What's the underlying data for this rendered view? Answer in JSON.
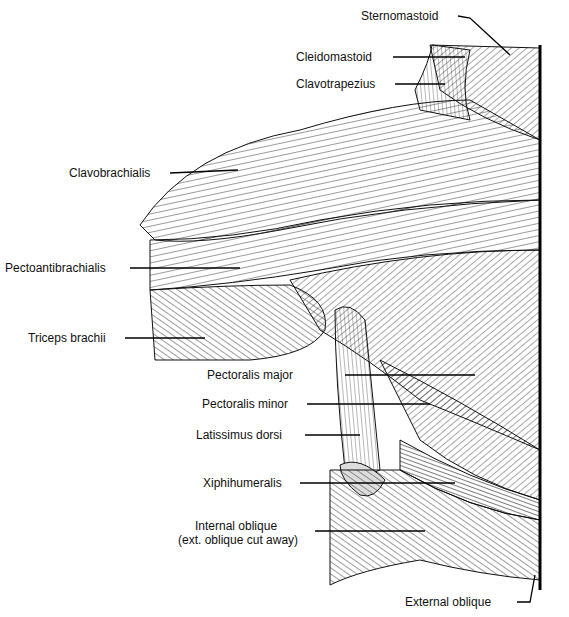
{
  "figure": {
    "labels": [
      {
        "id": "sternomastoid",
        "text": "Sternomastoid"
      },
      {
        "id": "cleidomastoid",
        "text": "Cleidomastoid"
      },
      {
        "id": "clavotrapezius",
        "text": "Clavotrapezius"
      },
      {
        "id": "clavobrachialis",
        "text": "Clavobrachialis"
      },
      {
        "id": "pectoantibrachialis",
        "text": "Pectoantibrachialis"
      },
      {
        "id": "triceps-brachii",
        "text": "Triceps brachii"
      },
      {
        "id": "pectoralis-major",
        "text": "Pectoralis major"
      },
      {
        "id": "pectoralis-minor",
        "text": "Pectoralis minor"
      },
      {
        "id": "latissimus-dorsi",
        "text": "Latissimus dorsi"
      },
      {
        "id": "xiphihumeralis",
        "text": "Xiphihumeralis"
      },
      {
        "id": "internal-oblique",
        "text": "Internal oblique"
      },
      {
        "id": "internal-oblique-note",
        "text": "(ext. oblique cut away)"
      },
      {
        "id": "external-oblique",
        "text": "External oblique"
      }
    ],
    "colors": {
      "ink": "#111111",
      "paper": "#ffffff",
      "shade": "#cfcfcf"
    }
  }
}
